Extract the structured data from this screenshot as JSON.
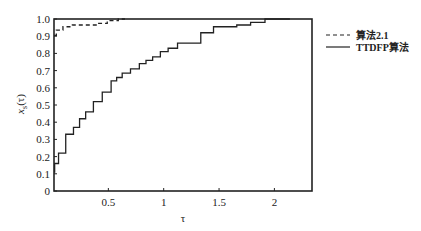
{
  "chart_data": {
    "type": "line",
    "title": "",
    "xlabel": "τ",
    "ylabel": "x_s(τ)",
    "ylabel_main": "x",
    "ylabel_sub": "s",
    "ylabel_tail": "(τ)",
    "xlim": [
      0,
      2.33
    ],
    "ylim": [
      0,
      1.0
    ],
    "xticks": [
      0.5,
      1,
      1.5,
      2
    ],
    "xtick_labels": [
      "0.5",
      "1",
      "1.5",
      "2"
    ],
    "yticks": [
      0,
      0.1,
      0.2,
      0.3,
      0.4,
      0.5,
      0.6,
      0.7,
      0.8,
      0.9,
      1.0
    ],
    "ytick_labels": [
      "0",
      "0.1",
      "0.2",
      "0.3",
      "0.4",
      "0.5",
      "0.6",
      "0.7",
      "0.8",
      "0.9",
      "1.0"
    ],
    "grid": false,
    "legend_position": "right-outside-top",
    "series": [
      {
        "name": "算法2.1",
        "style": "dashed",
        "color": "#222222",
        "x": [
          0.01,
          0.05,
          0.13,
          0.22,
          0.36,
          0.45,
          0.53,
          0.65
        ],
        "y": [
          0.905,
          0.935,
          0.955,
          0.965,
          0.965,
          0.975,
          0.99,
          1.0
        ]
      },
      {
        "name": "TTDFP算法",
        "style": "solid",
        "color": "#222222",
        "x": [
          0.01,
          0.02,
          0.08,
          0.15,
          0.22,
          0.26,
          0.33,
          0.4,
          0.49,
          0.56,
          0.59,
          0.66,
          0.74,
          0.82,
          0.86,
          0.94,
          1.0,
          1.08,
          1.17,
          1.28,
          1.39,
          1.51,
          1.6,
          1.72,
          1.85,
          1.98,
          2.14
        ],
        "y": [
          0.11,
          0.16,
          0.22,
          0.33,
          0.37,
          0.42,
          0.46,
          0.52,
          0.575,
          0.64,
          0.66,
          0.685,
          0.71,
          0.74,
          0.76,
          0.78,
          0.81,
          0.83,
          0.86,
          0.86,
          0.92,
          0.955,
          0.955,
          0.965,
          0.98,
          1.0,
          1.0
        ]
      }
    ]
  }
}
